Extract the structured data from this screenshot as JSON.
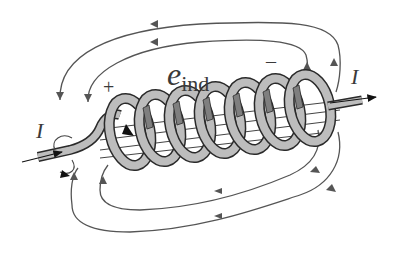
{
  "diagram": {
    "labels": {
      "emf_symbol": "e",
      "emf_subscript": "ind",
      "plus": "+",
      "minus": "–",
      "current_left": "I",
      "current_right": "I"
    },
    "elements": {
      "coil_turns": 7,
      "field_lines_top": 2,
      "field_lines_bottom": 2,
      "field_direction_top": "right-to-left",
      "field_direction_bottom": "right-to-left",
      "current_direction": "left-to-right"
    },
    "colors": {
      "coil_fill": "#bdbdbd",
      "coil_outline": "#2a2a2a",
      "coil_inner_shadow": "#7f7f7f",
      "field_line": "#555555",
      "text": "#3a3a3a",
      "background": "#ffffff"
    }
  }
}
